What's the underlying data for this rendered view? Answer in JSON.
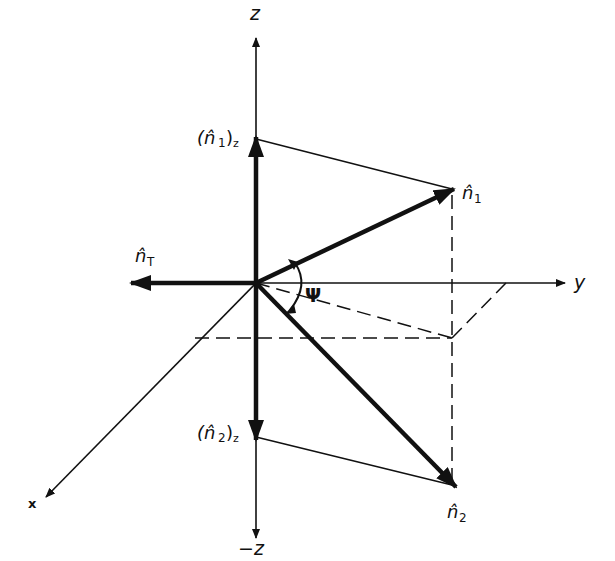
{
  "diagram": {
    "title": "",
    "labels": {
      "z_axis": "z",
      "neg_z_axis": "−z",
      "y_axis": "y",
      "x_axis": "x",
      "n1": "n̂",
      "n1_sub": "1",
      "n2": "n̂",
      "n2_sub": "2",
      "nT": "n̂",
      "nT_sub": "T",
      "n1z_open": "(n̂",
      "n1z_sub1": "1",
      "n1z_close": ")",
      "n1z_sub2": "z",
      "n2z_open": "(n̂",
      "n2z_sub1": "2",
      "n2z_close": ")",
      "n2z_sub2": "z",
      "angle": "Ψ"
    },
    "colors": {
      "ink": "#111111",
      "background": "#ffffff"
    }
  }
}
